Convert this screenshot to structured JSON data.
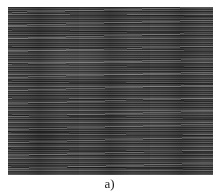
{
  "figure": {
    "image_description": "grayscale horizontal streak texture",
    "caption": "a)"
  }
}
